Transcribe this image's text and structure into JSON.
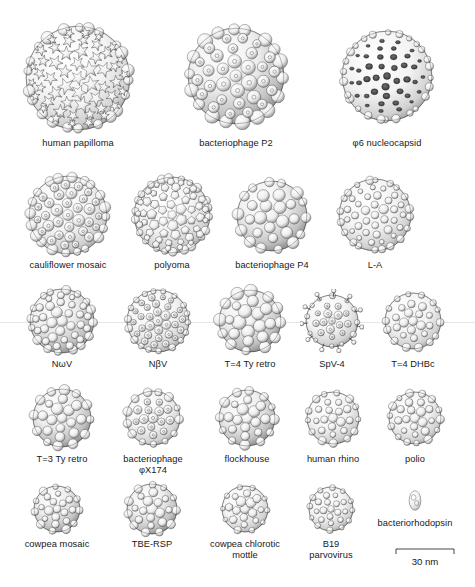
{
  "figure": {
    "background_color": "#ffffff",
    "ink_color": "#191919",
    "style": "grayscale surface-rendered virus capsid structures"
  },
  "rows": [
    {
      "row_index": 1,
      "specimens": [
        {
          "label": "human papilloma",
          "cx": 78,
          "cy": 78,
          "d": 104,
          "style": "papilloma",
          "caption_y": 136
        },
        {
          "label": "bacteriophage P2",
          "cx": 236,
          "cy": 76,
          "d": 96,
          "style": "p2",
          "caption_y": 136
        },
        {
          "label": "φ6 nucleocapsid",
          "cx": 387,
          "cy": 76,
          "d": 90,
          "style": "phi6",
          "caption_y": 136
        }
      ]
    },
    {
      "row_index": 2,
      "specimens": [
        {
          "label": "cauliflower mosaic",
          "cx": 68,
          "cy": 215,
          "d": 78,
          "style": "cauliflower",
          "caption_y": 258
        },
        {
          "label": "polyoma",
          "cx": 172,
          "cy": 215,
          "d": 76,
          "style": "polyoma",
          "caption_y": 258
        },
        {
          "label": "bacteriophage P4",
          "cx": 272,
          "cy": 216,
          "d": 70,
          "style": "p4",
          "caption_y": 258
        },
        {
          "label": "L-A",
          "cx": 375,
          "cy": 215,
          "d": 72,
          "style": "la",
          "caption_y": 258
        }
      ]
    },
    {
      "row_index": 3,
      "specimens": [
        {
          "label": "NωV",
          "cx": 62,
          "cy": 321,
          "d": 64,
          "style": "nwv",
          "caption_y": 357
        },
        {
          "label": "NβV",
          "cx": 158,
          "cy": 321,
          "d": 62,
          "style": "nbv",
          "caption_y": 357
        },
        {
          "label": "T=4 Ty retro",
          "cx": 250,
          "cy": 321,
          "d": 62,
          "style": "t4ty",
          "caption_y": 357
        },
        {
          "label": "SpV-4",
          "cx": 332,
          "cy": 321,
          "d": 52,
          "style": "spv4",
          "caption_y": 357
        },
        {
          "label": "T=4 DHBc",
          "cx": 413,
          "cy": 321,
          "d": 56,
          "style": "dhbc",
          "caption_y": 357
        }
      ]
    },
    {
      "row_index": 4,
      "specimens": [
        {
          "label": "T=3 Ty retro",
          "cx": 62,
          "cy": 418,
          "d": 58,
          "style": "t3ty",
          "caption_y": 452
        },
        {
          "label": "bacteriophage\nφX174",
          "cx": 153,
          "cy": 418,
          "d": 54,
          "style": "phix174",
          "caption_y": 452
        },
        {
          "label": "flockhouse",
          "cx": 247,
          "cy": 418,
          "d": 56,
          "style": "flockhouse",
          "caption_y": 452
        },
        {
          "label": "human rhino",
          "cx": 333,
          "cy": 418,
          "d": 52,
          "style": "rhino",
          "caption_y": 452
        },
        {
          "label": "polio",
          "cx": 415,
          "cy": 418,
          "d": 52,
          "style": "polio",
          "caption_y": 452
        }
      ]
    },
    {
      "row_index": 5,
      "specimens": [
        {
          "label": "cowpea mosaic",
          "cx": 57,
          "cy": 509,
          "d": 46,
          "style": "cowpea",
          "caption_y": 537
        },
        {
          "label": "TBE-RSP",
          "cx": 152,
          "cy": 509,
          "d": 50,
          "style": "tbersp",
          "caption_y": 537
        },
        {
          "label": "cowpea chlorotic\nmottle",
          "cx": 245,
          "cy": 509,
          "d": 46,
          "style": "ccmv",
          "caption_y": 537
        },
        {
          "label": "B19\nparvovirus",
          "cx": 331,
          "cy": 509,
          "d": 44,
          "style": "b19",
          "caption_y": 537
        },
        {
          "label": "bacteriorhodopsin",
          "cx": 415,
          "cy": 500,
          "d": 14,
          "style": "bacteriorhodopsin",
          "caption_y": 516
        }
      ]
    }
  ],
  "scale_bar": {
    "label": "30 nm",
    "x": 395,
    "y": 548,
    "width": 60,
    "tick_height": 5,
    "label_font_size": "9.6px"
  }
}
